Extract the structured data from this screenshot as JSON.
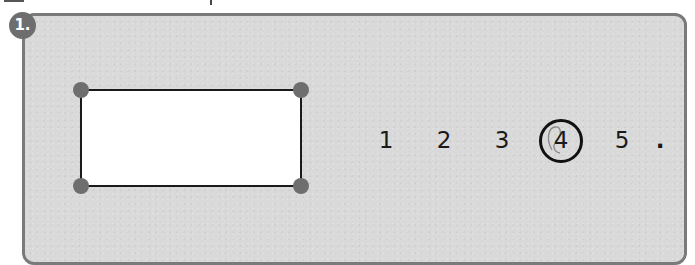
{
  "question": {
    "number_label": "1.",
    "shape": {
      "type": "rectangle",
      "vertices": 4,
      "vertex_color": "#6e6e6e",
      "fill": "#ffffff",
      "stroke": "#1a1a1a"
    },
    "options": [
      {
        "label": "1",
        "selected": false
      },
      {
        "label": "2",
        "selected": false
      },
      {
        "label": "3",
        "selected": false
      },
      {
        "label": "4",
        "selected": true
      },
      {
        "label": "5",
        "selected": false
      }
    ],
    "trailing": "."
  },
  "colors": {
    "panel_bg": "#d9d9d9",
    "panel_border": "#7a7a7a",
    "badge_bg": "#6e6e6e"
  }
}
